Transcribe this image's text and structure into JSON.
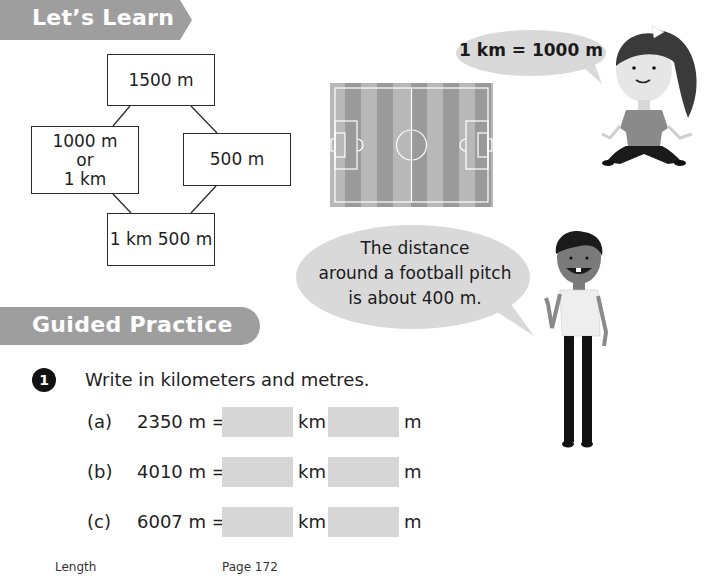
{
  "lets_learn": {
    "banner_title": "Let’s Learn",
    "diagram": {
      "top": "1500 m",
      "left_line1": "1000 m",
      "left_line2": "or",
      "left_line3": "1 km",
      "right": "500 m",
      "bottom": "1 km 500 m"
    },
    "girl_speech": "1 km = 1000 m",
    "boy_speech_line1": "The distance",
    "boy_speech_line2": "around a football pitch",
    "boy_speech_line3": "is about 400 m."
  },
  "guided_practice": {
    "banner_title": "Guided Practice",
    "question": {
      "number": "1",
      "instruction": "Write in kilometers and metres.",
      "rows": [
        {
          "label": "(a)",
          "expression": "2350 m =",
          "unit1": "km",
          "unit2": "m",
          "km_value": "",
          "m_value": ""
        },
        {
          "label": "(b)",
          "expression": "4010 m =",
          "unit1": "km",
          "unit2": "m",
          "km_value": "",
          "m_value": ""
        },
        {
          "label": "(c)",
          "expression": "6007 m =",
          "unit1": "km",
          "unit2": "m",
          "km_value": "",
          "m_value": ""
        }
      ]
    }
  },
  "footer": {
    "section": "Length",
    "page": "Page 172"
  },
  "colors": {
    "banner": "#9e9e9e",
    "answer_box": "#d6d6d6",
    "bubble": "#d9d9d9"
  }
}
